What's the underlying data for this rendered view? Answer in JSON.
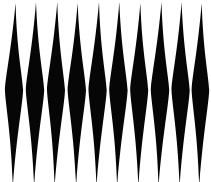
{
  "image": {
    "kind": "abstract-geometric-pattern",
    "title": "Vertical Diamond Spindle Pattern",
    "description": "Ten tall black vertical lens/diamond (spindle) shapes on a white background, widest at the vertical midline and tapering to sharp points at top and bottom.",
    "width": 211,
    "height": 182
  },
  "palette": {
    "background": "#ffffff",
    "foreground": "#060606",
    "edge_softening": "#2a2a2a"
  },
  "pattern": {
    "shape_name": "vertical-diamond-spindle",
    "count": 10,
    "spacing_px": 20.9,
    "first_center_x": 14.0,
    "waist_y": 90,
    "top_tip_y": 2,
    "bottom_tip_y": 186,
    "max_half_width": 9.2,
    "gap_at_waist_px": 2.5,
    "curvature": 0.18,
    "shapes": [
      {
        "index": 1,
        "center_x": 14.0,
        "half_width": 9.1,
        "top_tip_y": 3,
        "bottom_tip_y": 186,
        "top_tip_x_offset": 1.6,
        "bottom_tip_x_offset": -1.2
      },
      {
        "index": 2,
        "center_x": 35.0,
        "half_width": 9.2,
        "top_tip_y": 2,
        "bottom_tip_y": 186,
        "top_tip_x_offset": 1.0,
        "bottom_tip_x_offset": -0.9
      },
      {
        "index": 3,
        "center_x": 56.0,
        "half_width": 9.0,
        "top_tip_y": 2,
        "bottom_tip_y": 186,
        "top_tip_x_offset": 1.3,
        "bottom_tip_x_offset": -1.4
      },
      {
        "index": 4,
        "center_x": 76.8,
        "half_width": 9.2,
        "top_tip_y": 3,
        "bottom_tip_y": 186,
        "top_tip_x_offset": 0.8,
        "bottom_tip_x_offset": -0.7
      },
      {
        "index": 5,
        "center_x": 97.6,
        "half_width": 9.1,
        "top_tip_y": 2,
        "bottom_tip_y": 186,
        "top_tip_x_offset": 1.4,
        "bottom_tip_x_offset": -1.1
      },
      {
        "index": 6,
        "center_x": 118.4,
        "half_width": 9.2,
        "top_tip_y": 2,
        "bottom_tip_y": 186,
        "top_tip_x_offset": 0.9,
        "bottom_tip_x_offset": -1.3
      },
      {
        "index": 7,
        "center_x": 139.2,
        "half_width": 9.0,
        "top_tip_y": 3,
        "bottom_tip_y": 186,
        "top_tip_x_offset": 1.2,
        "bottom_tip_x_offset": -0.8
      },
      {
        "index": 8,
        "center_x": 160.0,
        "half_width": 9.2,
        "top_tip_y": 2,
        "bottom_tip_y": 186,
        "top_tip_x_offset": 1.5,
        "bottom_tip_x_offset": -1.5
      },
      {
        "index": 9,
        "center_x": 180.6,
        "half_width": 9.1,
        "top_tip_y": 2,
        "bottom_tip_y": 186,
        "top_tip_x_offset": 1.0,
        "bottom_tip_x_offset": -1.0
      },
      {
        "index": 10,
        "center_x": 200.4,
        "half_width": 8.8,
        "top_tip_y": 3,
        "bottom_tip_y": 186,
        "top_tip_x_offset": 1.3,
        "bottom_tip_x_offset": -1.2
      }
    ]
  }
}
